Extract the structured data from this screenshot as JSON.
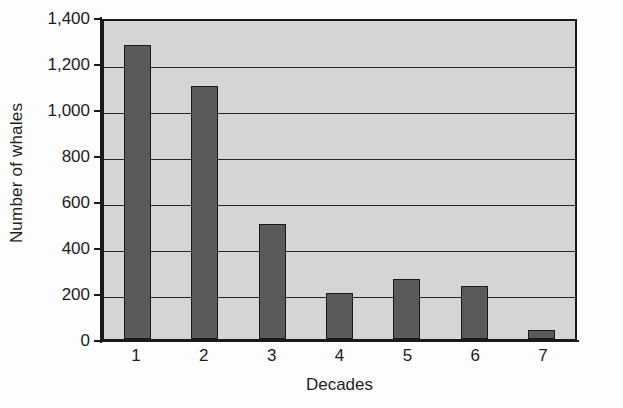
{
  "chart_data": {
    "type": "bar",
    "title": "",
    "subtitle": "",
    "xlabel": "Decades",
    "ylabel": "Number of whales",
    "categories": [
      "1",
      "2",
      "3",
      "4",
      "5",
      "6",
      "7"
    ],
    "values": [
      1280,
      1100,
      500,
      200,
      260,
      230,
      40
    ],
    "series": [
      {
        "name": "Number of whales",
        "values": [
          1280,
          1100,
          500,
          200,
          260,
          230,
          40
        ]
      }
    ],
    "ylim": [
      0,
      1400
    ],
    "y_tick_values": [
      0,
      200,
      400,
      600,
      800,
      1000,
      1200,
      1400
    ],
    "y_tick_labels": [
      "0",
      "200",
      "400",
      "600",
      "800",
      "1,000",
      "1,200",
      "1,400"
    ],
    "grid": true,
    "grid_orientation": "horizontal",
    "legend": false,
    "legend_position": "none",
    "annotations": [],
    "colors": {
      "bar_fill": "#5a5a5a",
      "bar_border": "#1a1a1a",
      "plot_background": "#d5d5d5",
      "axis": "#1a1a1a",
      "gridline": "#262626",
      "text": "#1c1c1c",
      "figure_background": "#fdfdfd"
    }
  }
}
